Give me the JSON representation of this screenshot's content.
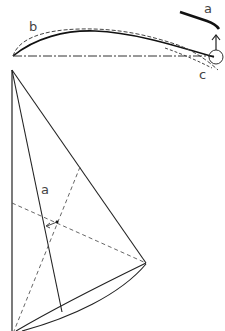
{
  "diagram": {
    "colors": {
      "line": "#222222",
      "background": "#ffffff"
    },
    "section": {
      "labels": {
        "a": "a",
        "b": "b",
        "c": "c"
      },
      "elements": [
        "chord-line",
        "sail-arc-solid",
        "sail-arc-dashed-b",
        "sail-trailing-dashed-c",
        "leech-pivot-circle",
        "up-arrow",
        "thick-stroke-a"
      ]
    },
    "plan": {
      "labels": {
        "a": "a"
      },
      "elements": [
        "luff-line",
        "leech-line",
        "mast-line",
        "foot-curves",
        "dashed-diagonal-1",
        "dashed-diagonal-2",
        "center-arrow"
      ]
    }
  }
}
